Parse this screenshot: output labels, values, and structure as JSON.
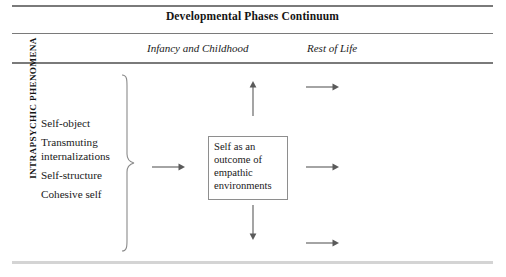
{
  "figure": {
    "title": "Developmental Phases Continuum",
    "column_headers": [
      {
        "label": "Infancy and Childhood"
      },
      {
        "label": "Rest of Life"
      }
    ],
    "row_label": "INTRAPSYCHIC PHENOMENA",
    "items": [
      {
        "label": "Self-object"
      },
      {
        "label": "Transmuting internalizations"
      },
      {
        "label": "Self-structure"
      },
      {
        "label": "Cohesive self"
      }
    ],
    "center_box": {
      "text": "Self as an outcome of empathic environments"
    },
    "arrows": [
      {
        "name": "arrow-up-top",
        "direction": "up"
      },
      {
        "name": "arrow-right-top",
        "direction": "right"
      },
      {
        "name": "arrow-right-middle-left",
        "direction": "right"
      },
      {
        "name": "arrow-right-middle-right",
        "direction": "right"
      },
      {
        "name": "arrow-down-bottom",
        "direction": "down"
      },
      {
        "name": "arrow-right-bottom",
        "direction": "right"
      }
    ],
    "brace": {
      "name": "right-curly-brace",
      "glyph": "}"
    },
    "colors": {
      "rule": "#7a7a7a",
      "footer_rule": "#d4d4d4",
      "box_border": "#8e8e8e",
      "text": "#1a1a1a",
      "arrow": "#5a5a5a"
    }
  }
}
